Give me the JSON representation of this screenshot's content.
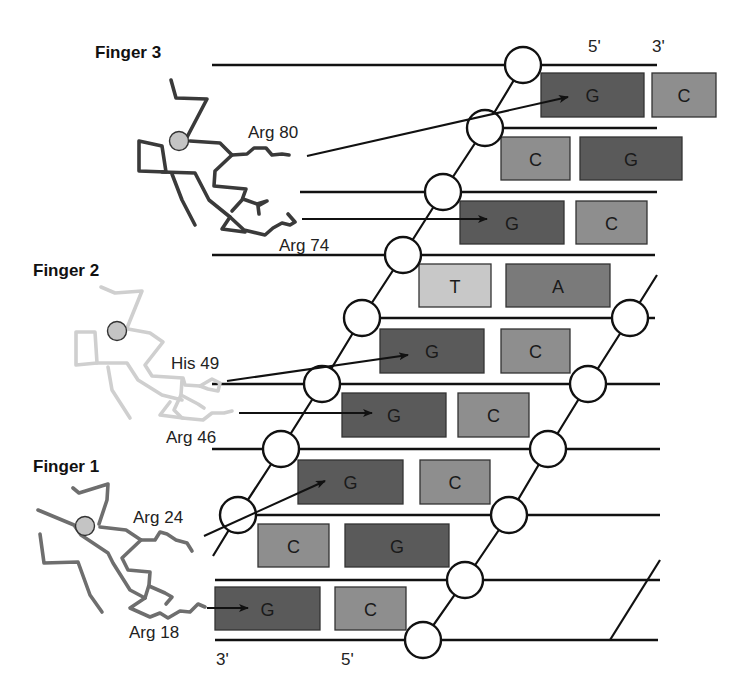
{
  "figure": {
    "fingers": [
      {
        "id": "finger3",
        "title": "Finger 3",
        "title_pos": [
          95,
          58
        ],
        "chain_color": "#3a3a3a",
        "zinc_color": "#c4c4c4",
        "zinc_center": [
          179,
          141
        ],
        "residues": [
          {
            "label": "Arg 80",
            "label_pos": [
              248,
              138
            ]
          },
          {
            "label": "Arg 74",
            "label_pos": [
              279,
              251
            ]
          }
        ]
      },
      {
        "id": "finger2",
        "title": "Finger 2",
        "title_pos": [
          33,
          276
        ],
        "chain_color": "#cfcfcf",
        "zinc_color": "#c4c4c4",
        "zinc_center": [
          117,
          331
        ],
        "residues": [
          {
            "label": "His 49",
            "label_pos": [
              171,
              369
            ]
          },
          {
            "label": "Arg 46",
            "label_pos": [
              166,
              443
            ]
          }
        ]
      },
      {
        "id": "finger1",
        "title": "Finger 1",
        "title_pos": [
          33,
          472
        ],
        "chain_color": "#6e6e6e",
        "zinc_color": "#c4c4c4",
        "zinc_center": [
          85,
          526
        ],
        "residues": [
          {
            "label": "Arg 24",
            "label_pos": [
              133,
              523
            ]
          },
          {
            "label": "Arg 18",
            "label_pos": [
              129,
              638
            ]
          }
        ]
      }
    ],
    "strand_end_labels": [
      {
        "text": "5'",
        "pos": [
          588,
          52
        ]
      },
      {
        "text": "3'",
        "pos": [
          652,
          52
        ]
      },
      {
        "text": "3'",
        "pos": [
          216,
          665
        ]
      },
      {
        "text": "5'",
        "pos": [
          341,
          665
        ]
      }
    ],
    "base_colors": {
      "G": "#5a5a5a",
      "C": "#8e8e8e",
      "T": "#c8c8c8",
      "A": "#7a7a7a"
    },
    "base_pairs": [
      {
        "row": 1,
        "left": {
          "base": "G",
          "x": 541,
          "y": 73,
          "w": 103,
          "h": 44
        },
        "right": {
          "base": "C",
          "x": 652,
          "y": 73,
          "w": 64,
          "h": 44
        }
      },
      {
        "row": 2,
        "left": {
          "base": "C",
          "x": 501,
          "y": 137,
          "w": 69,
          "h": 43
        },
        "right": {
          "base": "G",
          "x": 580,
          "y": 137,
          "w": 102,
          "h": 43
        }
      },
      {
        "row": 3,
        "left": {
          "base": "G",
          "x": 460,
          "y": 201,
          "w": 104,
          "h": 43
        },
        "right": {
          "base": "C",
          "x": 576,
          "y": 201,
          "w": 71,
          "h": 43
        }
      },
      {
        "row": 4,
        "left": {
          "base": "T",
          "x": 419,
          "y": 264,
          "w": 72,
          "h": 43
        },
        "right": {
          "base": "A",
          "x": 506,
          "y": 264,
          "w": 104,
          "h": 43
        }
      },
      {
        "row": 5,
        "left": {
          "base": "G",
          "x": 380,
          "y": 329,
          "w": 104,
          "h": 44
        },
        "right": {
          "base": "C",
          "x": 501,
          "y": 329,
          "w": 69,
          "h": 44
        }
      },
      {
        "row": 6,
        "left": {
          "base": "G",
          "x": 342,
          "y": 393,
          "w": 104,
          "h": 44
        },
        "right": {
          "base": "C",
          "x": 458,
          "y": 393,
          "w": 71,
          "h": 44
        }
      },
      {
        "row": 7,
        "left": {
          "base": "G",
          "x": 298,
          "y": 460,
          "w": 105,
          "h": 44
        },
        "right": {
          "base": "C",
          "x": 420,
          "y": 460,
          "w": 70,
          "h": 44
        }
      },
      {
        "row": 8,
        "left": {
          "base": "C",
          "x": 258,
          "y": 524,
          "w": 71,
          "h": 43
        },
        "right": {
          "base": "G",
          "x": 345,
          "y": 524,
          "w": 104,
          "h": 43
        }
      },
      {
        "row": 9,
        "left": {
          "base": "G",
          "x": 215,
          "y": 587,
          "w": 105,
          "h": 43
        },
        "right": {
          "base": "C",
          "x": 335,
          "y": 587,
          "w": 71,
          "h": 43
        }
      }
    ],
    "contacts": [
      {
        "from": "Arg 80",
        "start": [
          307,
          156
        ],
        "end": [
          568,
          97
        ]
      },
      {
        "from": "Arg 74",
        "start": [
          302,
          219
        ],
        "end": [
          487,
          219
        ]
      },
      {
        "from": "His 49",
        "start": [
          227,
          381
        ],
        "end": [
          408,
          355
        ]
      },
      {
        "from": "Arg 46",
        "start": [
          239,
          413
        ],
        "end": [
          372,
          413
        ]
      },
      {
        "from": "Arg 24",
        "start": [
          204,
          536
        ],
        "end": [
          325,
          481
        ]
      },
      {
        "from": "Arg 18",
        "start": [
          207,
          608
        ],
        "end": [
          248,
          608
        ]
      }
    ]
  }
}
